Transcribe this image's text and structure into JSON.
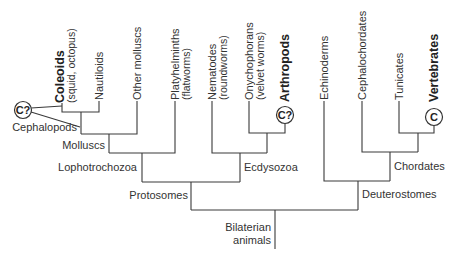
{
  "diagram": {
    "type": "phylogenetic-tree",
    "root": {
      "label_line1": "Bilaterian",
      "label_line2": "animals"
    },
    "clades": {
      "protosomes": "Protosomes",
      "deuterostomes": "Deuterostomes",
      "lophotrochozoa": "Lophotrochozoa",
      "ecdysozoa": "Ecdysozoa",
      "molluscs": "Molluscs",
      "cephalopods": "Cephalopods",
      "chordates": "Chordates"
    },
    "leaves": [
      {
        "id": "coleoids",
        "label": "Coleoids",
        "sublabel": "(squid, octopus)",
        "bold": true
      },
      {
        "id": "nautiloids",
        "label": "Nautiloids",
        "sublabel": "",
        "bold": false
      },
      {
        "id": "other-molluscs",
        "label": "Other molluscs",
        "sublabel": "",
        "bold": false
      },
      {
        "id": "platyhelminths",
        "label": "Platyhelminths",
        "sublabel": "(flatworms)",
        "bold": false
      },
      {
        "id": "nematodes",
        "label": "Nematodes",
        "sublabel": "(roundworms)",
        "bold": false
      },
      {
        "id": "onychophorans",
        "label": "Onychophorans",
        "sublabel": "(velvet worms)",
        "bold": false
      },
      {
        "id": "arthropods",
        "label": "Arthropods",
        "sublabel": "",
        "bold": true
      },
      {
        "id": "echinoderms",
        "label": "Echinoderms",
        "sublabel": "",
        "bold": false
      },
      {
        "id": "cephalochordates",
        "label": "Cephalochordates",
        "sublabel": "",
        "bold": false
      },
      {
        "id": "tunicates",
        "label": "Tunicates",
        "sublabel": "",
        "bold": false
      },
      {
        "id": "vertebrates",
        "label": "Vertebrates",
        "sublabel": "",
        "bold": true
      }
    ],
    "markers": {
      "cephalopod_marker": "C?",
      "arthropod_marker": "C?",
      "vertebrate_marker": "C"
    }
  }
}
